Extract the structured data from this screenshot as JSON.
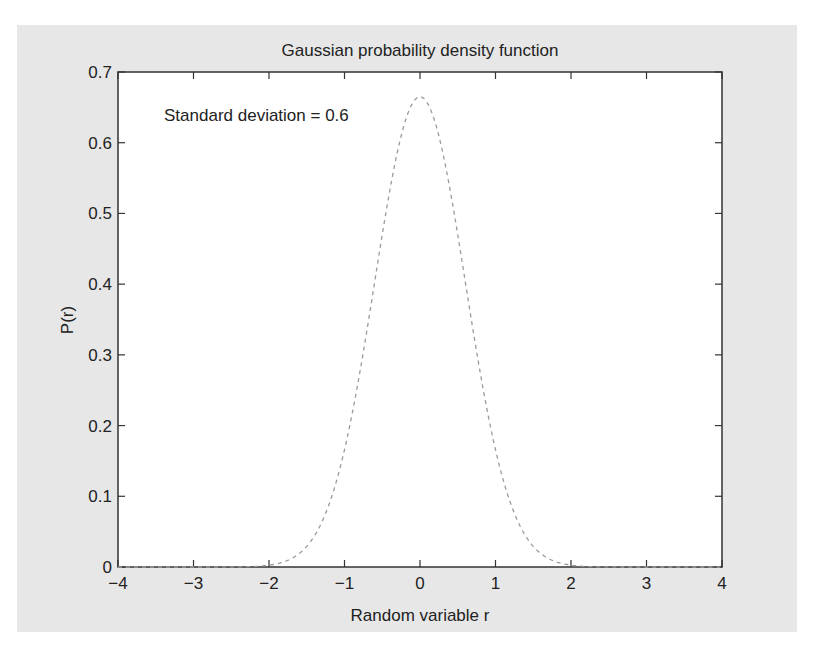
{
  "chart_data": {
    "type": "line",
    "title": "Gaussian probability density function",
    "xlabel": "Random variable r",
    "ylabel": "P(r)",
    "xlim": [
      -4,
      4
    ],
    "ylim": [
      0,
      0.7
    ],
    "grid": false,
    "legend": null,
    "x_ticks": [
      -4,
      -3,
      -2,
      -1,
      0,
      1,
      2,
      3,
      4
    ],
    "x_tick_labels": [
      "−4",
      "−3",
      "−2",
      "−1",
      "0",
      "1",
      "2",
      "3",
      "4"
    ],
    "y_ticks": [
      0,
      0.1,
      0.2,
      0.3,
      0.4,
      0.5,
      0.6,
      0.7
    ],
    "y_tick_labels": [
      "0",
      "0.1",
      "0.2",
      "0.3",
      "0.4",
      "0.5",
      "0.6",
      "0.7"
    ],
    "annotations": [
      {
        "text": "Standard deviation = 0.6",
        "x": -3.4,
        "y": 0.64
      }
    ],
    "series": [
      {
        "name": "Gaussian pdf (mean 0, sd 0.6)",
        "style": "dashed",
        "color": "#9a9a9a",
        "mean": 0,
        "std": 0.6,
        "x": [
          -4,
          -3.5,
          -3,
          -2.5,
          -2,
          -1.75,
          -1.5,
          -1.25,
          -1,
          -0.75,
          -0.5,
          -0.25,
          0,
          0.25,
          0.5,
          0.75,
          1,
          1.25,
          1.5,
          1.75,
          2,
          2.5,
          3,
          3.5,
          4
        ],
        "values": [
          0.0,
          0.0,
          0.0,
          0.0001,
          0.0025,
          0.0094,
          0.0292,
          0.0756,
          0.1656,
          0.3046,
          0.4726,
          0.6093,
          0.6649,
          0.6093,
          0.4726,
          0.3046,
          0.1656,
          0.0756,
          0.0292,
          0.0094,
          0.0025,
          0.0001,
          0.0,
          0.0,
          0.0
        ]
      }
    ]
  },
  "colors": {
    "panel_background": "#e7e7e7",
    "plot_background": "#ffffff",
    "axis": "#333333",
    "curve": "#9a9a9a"
  }
}
